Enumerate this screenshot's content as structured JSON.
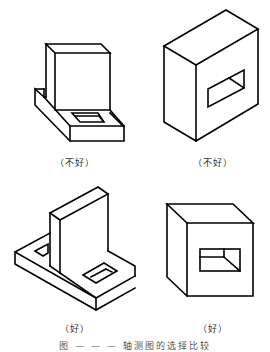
{
  "figure": {
    "panels": [
      {
        "id": "top-left",
        "label": "（不好）",
        "verdict": "bad",
        "object": "L-bracket with block and recessed hole"
      },
      {
        "id": "top-right",
        "label": "（不好）",
        "verdict": "bad",
        "object": "box with rectangular through-hole"
      },
      {
        "id": "bottom-left",
        "label": "（好）",
        "verdict": "good",
        "object": "L-bracket with two recessed holes"
      },
      {
        "id": "bottom-right",
        "label": "（好）",
        "verdict": "good",
        "object": "box with rectangular through-hole"
      }
    ],
    "caption": "图 — — — 轴测图的选择比较"
  },
  "colors": {
    "line": "#000000",
    "background": "#ffffff",
    "label": "#333333"
  }
}
